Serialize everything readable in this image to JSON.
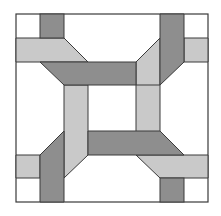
{
  "colors": {
    "background": "#ffffff",
    "dark": "#8e8e8e",
    "light": "#c9c9c9",
    "stroke": "#3a3a3a"
  },
  "pieces": {
    "dark": [
      "40,14 64,14 64,38 40,38",
      "40,62 136,62 136,85 64,85",
      "160,14 184,14 184,85 160,108",
      "64,131 88,108 88,202 64,202",
      "88,131 184,155 160,155 88,155",
      "160,178 184,178 184,202 160,202"
    ],
    "light": [
      "16,38 64,38 88,62 16,62",
      "64,85 88,85 88,202 64,202",
      "136,85 160,62 160,155 136,155",
      "184,38 208,38 208,62 184,62",
      "136,131 208,131 208,155 136,155",
      "16,131 40,131 40,155 16,155"
    ]
  }
}
